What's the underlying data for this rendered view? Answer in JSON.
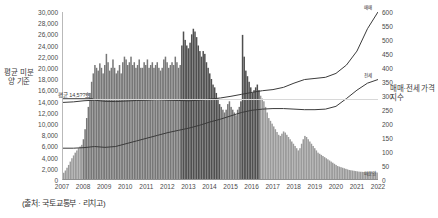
{
  "axes": {
    "left_title": "평균 미분양 기준",
    "right_title": "매매·전세 가격지수",
    "left_ticks": [
      "30,000",
      "28,000",
      "26,000",
      "24,000",
      "22,000",
      "20,000",
      "18,000",
      "16,000",
      "14,000",
      "12,000",
      "10,000",
      "8,000",
      "6,000",
      "4,000",
      "2,000",
      "0"
    ],
    "right_ticks": [
      "600",
      "550",
      "500",
      "450",
      "400",
      "350",
      "300",
      "250",
      "200",
      "150",
      "100",
      "50",
      "0"
    ],
    "x_ticks": [
      "2007",
      "2008",
      "2009",
      "2010",
      "2011",
      "2012",
      "2013",
      "2014",
      "2015",
      "2016",
      "2017",
      "2018",
      "2019",
      "2020",
      "2021",
      "2022"
    ]
  },
  "annotation": {
    "avg_label": "평균 14,5??호",
    "avg_value": 14500
  },
  "series_labels": {
    "sale": "매매",
    "jeonse": "전세",
    "bars": "미분양"
  },
  "footer": {
    "source": "(출처: 국토교통부 · 리치고)"
  },
  "colors": {
    "bar_light": "#9a9a9a",
    "bar_dark": "#4f4f4f",
    "line": "#3a3a3a",
    "grid": "#d8d8d8",
    "axis": "#8f8f8f",
    "background": "#ffffff"
  },
  "chart_data": {
    "type": "bar",
    "title": "",
    "subtitle": "",
    "xlabel": "",
    "ylabel": "평균 미분양 기준",
    "y2label": "매매·전세 가격지수",
    "ylim": [
      0,
      30000
    ],
    "y2lim": [
      0,
      600
    ],
    "grid": false,
    "legend_position": "series-end-labels",
    "x_start": 2007.0,
    "x_end": 2022.0,
    "categories": [
      "2007",
      "2008",
      "2009",
      "2010",
      "2011",
      "2012",
      "2013",
      "2014",
      "2015",
      "2016",
      "2017",
      "2018",
      "2019",
      "2020",
      "2021",
      "2022"
    ],
    "bars": {
      "name": "미분양 (unsold units, monthly)",
      "axis": "left",
      "values": [
        1200,
        1600,
        2100,
        2600,
        3200,
        3800,
        4300,
        4800,
        5200,
        5600,
        5900,
        6200,
        7200,
        9000,
        11000,
        13000,
        15500,
        17500,
        19000,
        20500,
        20000,
        19500,
        20800,
        20000,
        19000,
        20500,
        22500,
        21000,
        19500,
        20000,
        21500,
        20000,
        19000,
        19500,
        20500,
        19000,
        21000,
        22000,
        21500,
        20500,
        21000,
        22000,
        20500,
        21000,
        20000,
        20500,
        21500,
        20000,
        20000,
        21000,
        20500,
        21500,
        20000,
        20500,
        21000,
        20000,
        20500,
        21000,
        20000,
        19500,
        20000,
        21500,
        22000,
        21000,
        20000,
        20500,
        21000,
        20500,
        22000,
        21000,
        20000,
        20500,
        24000,
        26500,
        25000,
        24000,
        23500,
        24500,
        26000,
        27000,
        26500,
        25500,
        24000,
        23000,
        22000,
        23000,
        22500,
        21000,
        20000,
        19000,
        18000,
        17000,
        16500,
        15500,
        14500,
        13500,
        13000,
        12500,
        12000,
        12500,
        13500,
        14000,
        13000,
        12500,
        12000,
        11500,
        12500,
        13000,
        14000,
        25900,
        22000,
        19500,
        18500,
        17500,
        16500,
        15500,
        16000,
        16500,
        17000,
        16000,
        15000,
        14500,
        14000,
        13000,
        12000,
        11000,
        10500,
        10000,
        9500,
        9000,
        8500,
        8000,
        7800,
        8200,
        8600,
        8400,
        8000,
        7600,
        7200,
        6800,
        6400,
        6000,
        5600,
        5200,
        5600,
        6400,
        7200,
        7800,
        7600,
        7200,
        6800,
        6400,
        6000,
        5600,
        5200,
        4800,
        4600,
        4400,
        4200,
        4000,
        3800,
        3600,
        3400,
        3200,
        3000,
        2800,
        2600,
        2400,
        2300,
        2200,
        2100,
        2000,
        1900,
        1800,
        1700,
        1650,
        1600,
        1550,
        1500,
        1450,
        1400,
        1380,
        1360,
        1340,
        1320,
        1300,
        1290,
        1280,
        1270,
        1260,
        1250,
        1240
      ]
    },
    "series": [
      {
        "name": "매매",
        "axis": "right",
        "label_at_end": "매매",
        "x": [
          2007.0,
          2007.5,
          2008.0,
          2008.5,
          2009.0,
          2009.5,
          2010.0,
          2010.5,
          2011.0,
          2011.5,
          2012.0,
          2012.5,
          2013.0,
          2013.5,
          2014.0,
          2014.5,
          2015.0,
          2015.5,
          2016.0,
          2016.5,
          2017.0,
          2017.5,
          2018.0,
          2018.5,
          2019.0,
          2019.5,
          2020.0,
          2020.5,
          2021.0,
          2021.5,
          2022.0
        ],
        "values": [
          276,
          278,
          282,
          284,
          280,
          279,
          281,
          283,
          284,
          286,
          284,
          283,
          282,
          284,
          288,
          292,
          298,
          305,
          312,
          318,
          322,
          330,
          345,
          358,
          362,
          366,
          380,
          410,
          460,
          540,
          600
        ]
      },
      {
        "name": "전세",
        "axis": "right",
        "label_at_end": "전세",
        "x": [
          2007.0,
          2007.5,
          2008.0,
          2008.5,
          2009.0,
          2009.5,
          2010.0,
          2010.5,
          2011.0,
          2011.5,
          2012.0,
          2012.5,
          2013.0,
          2013.5,
          2014.0,
          2014.5,
          2015.0,
          2015.5,
          2016.0,
          2016.5,
          2017.0,
          2017.5,
          2018.0,
          2018.5,
          2019.0,
          2019.5,
          2020.0,
          2020.5,
          2021.0,
          2021.5,
          2022.0
        ],
        "values": [
          112,
          112,
          114,
          118,
          115,
          118,
          128,
          138,
          148,
          158,
          168,
          176,
          184,
          194,
          206,
          216,
          228,
          240,
          248,
          252,
          254,
          254,
          252,
          250,
          250,
          252,
          262,
          290,
          320,
          345,
          358
        ]
      }
    ],
    "annotations": [
      {
        "type": "hline",
        "axis": "left",
        "value": 14500,
        "label": "평균 14,5??호"
      }
    ]
  }
}
